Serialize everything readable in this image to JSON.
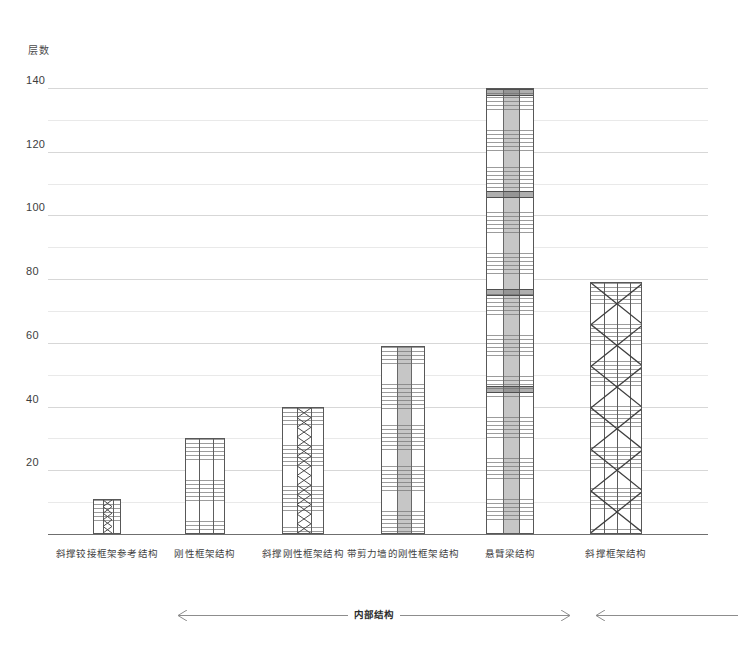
{
  "chart_data": {
    "type": "bar",
    "title": "",
    "ylabel": "层数",
    "xlabel": "",
    "ylim": [
      0,
      145
    ],
    "ytick_values": [
      20,
      40,
      60,
      80,
      100,
      120,
      140
    ],
    "ytick_labels": [
      "20",
      "40",
      "60",
      "80",
      "100",
      "120",
      "140"
    ],
    "grid": "horizontal gridlines every 10 floors, labels every 20",
    "legend": "none",
    "categories": [
      "斜撑铰接框架参考结构",
      "刚性框架结构",
      "斜撑刚性框架结构",
      "带剪力墙的刚性框架结构",
      "悬臂梁结构",
      "斜撑框架结构"
    ],
    "values": [
      11,
      30,
      40,
      59,
      140,
      79
    ],
    "bar_styles": [
      "braced-hinged-frame",
      "rigid-frame",
      "braced-rigid-frame",
      "rigid-frame-with-shear-wall",
      "outrigger-cantilever",
      "braced-tube"
    ]
  },
  "annotation": {
    "primary_label": "内部结构",
    "secondary_label": ""
  }
}
